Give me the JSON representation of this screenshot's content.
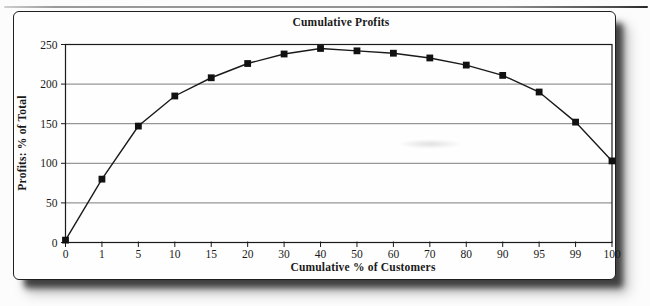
{
  "chart_data": {
    "type": "line",
    "title": "Cumulative Profits",
    "xlabel": "Cumulative % of Customers",
    "ylabel": "Profits: % of Total",
    "categories": [
      "0",
      "1",
      "5",
      "10",
      "15",
      "20",
      "30",
      "40",
      "50",
      "60",
      "70",
      "80",
      "90",
      "95",
      "99",
      "100"
    ],
    "values": [
      3,
      80,
      147,
      185,
      208,
      226,
      238,
      245,
      242,
      239,
      233,
      224,
      211,
      190,
      152,
      103
    ],
    "y_ticks": [
      0,
      50,
      100,
      150,
      200,
      250
    ],
    "ylim": [
      0,
      250
    ],
    "grid": "horizontal",
    "legend": "none",
    "marker": "square",
    "colors": {
      "line": "#1a1a1a",
      "marker": "#111111",
      "gridline": "#7d7d7d",
      "plot_border": "#1a1a1a",
      "text": "#1a1a1a"
    }
  }
}
